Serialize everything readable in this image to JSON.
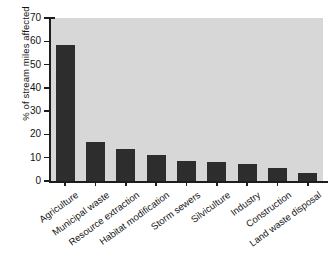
{
  "chart_data": {
    "type": "bar",
    "title": "",
    "xlabel": "",
    "ylabel": "% of stream miles affected",
    "ylim": [
      0,
      70
    ],
    "ytick_values": [
      70,
      60,
      50,
      40,
      30,
      20,
      10,
      0
    ],
    "ytick_labels": [
      "70",
      "60",
      "50",
      "40",
      "30",
      "20",
      "10",
      "0"
    ],
    "grid": false,
    "legend": "none",
    "bar_color": "#2d2d2d",
    "plot_background": "#d7d7d7",
    "figure_background": "#ffffff",
    "categories": [
      "Agriculture",
      "Municipal waste",
      "Resource extraction",
      "Habitat modification",
      "Storm sewers",
      "Silviculture",
      "Industry",
      "Construction",
      "Land waste disposal"
    ],
    "values": [
      58.5,
      16.7,
      13.7,
      11.2,
      8.5,
      8.1,
      7.3,
      5.8,
      3.4
    ]
  }
}
